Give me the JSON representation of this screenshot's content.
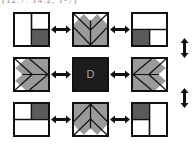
{
  "figure": {
    "clipped_caption": "(12.7. 14.2, 1-7)",
    "center_label": "D",
    "colors": {
      "outline": "#111111",
      "light_fill": "#ffffff",
      "mid_gray": "#9a9a9a",
      "dark_gray": "#5a5a5a",
      "center_black": "#1c1c1c",
      "center_text": "#a8a8a8",
      "arrow": "#111111",
      "background": "#ffffff"
    },
    "grid": {
      "rows": 3,
      "cols": 3,
      "blocks": [
        {
          "id": "block-top-left",
          "name": "vertical-split-dark-bottom-right",
          "description": "Square divided by a vertical line; right half split horizontally with dark gray lower-right quadrant"
        },
        {
          "id": "block-top-center",
          "name": "chevron-down",
          "description": "Gray downward-pointing chevron with white corner triangles and white center notch"
        },
        {
          "id": "block-top-right",
          "name": "horizontal-split-dark-bottom-left",
          "description": "Square divided by a horizontal line; bottom half split vertically with dark gray lower-left quadrant"
        },
        {
          "id": "block-middle-left",
          "name": "chevron-right",
          "description": "Gray right-pointing chevron with white triangle notch on the left edge"
        },
        {
          "id": "block-center",
          "name": "center-solid-block",
          "description": "Solid near-black square labelled D"
        },
        {
          "id": "block-middle-right",
          "name": "chevron-left",
          "description": "Gray left-pointing chevron with white triangle notch on the right edge"
        },
        {
          "id": "block-bottom-left",
          "name": "horizontal-split-dark-top-right",
          "description": "Square divided by a horizontal line; top half split vertically with dark gray upper-right quadrant"
        },
        {
          "id": "block-bottom-center",
          "name": "chevron-up",
          "description": "Gray upward-pointing chevron with white corner triangles and white center notch"
        },
        {
          "id": "block-bottom-right",
          "name": "vertical-split-dark-top-left",
          "description": "Square divided by a vertical line; left half split horizontally with dark gray upper-left quadrant"
        }
      ],
      "horizontal_arrows": [
        {
          "id": "arrow-h-r1-c1",
          "name": "double-arrow-horizontal"
        },
        {
          "id": "arrow-h-r1-c2",
          "name": "double-arrow-horizontal"
        },
        {
          "id": "arrow-h-r2-c1",
          "name": "double-arrow-horizontal"
        },
        {
          "id": "arrow-h-r2-c2",
          "name": "double-arrow-horizontal"
        },
        {
          "id": "arrow-h-r3-c1",
          "name": "double-arrow-horizontal"
        },
        {
          "id": "arrow-h-r3-c2",
          "name": "double-arrow-horizontal"
        }
      ],
      "vertical_arrows": [
        {
          "id": "arrow-v-top",
          "name": "double-arrow-vertical"
        },
        {
          "id": "arrow-v-bottom",
          "name": "double-arrow-vertical"
        }
      ]
    }
  }
}
